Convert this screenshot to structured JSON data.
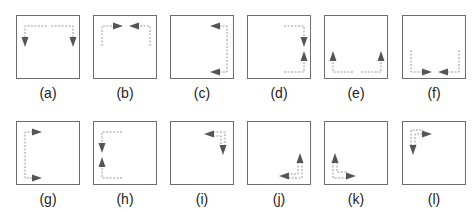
{
  "figure": {
    "colors": {
      "border": "#6e6e6e",
      "path": "#9a9a9a",
      "arrow": "#555555"
    },
    "panels": [
      {
        "label": "(a)",
        "description": "top edge paths from center outward, arrows pointing down at top-left and top-right corners",
        "paths": [
          "M30,10 L8,10 L8,22",
          "M34,10 L56,10 L56,22"
        ],
        "arrows": [
          {
            "x": 8,
            "y": 26,
            "dir": "down"
          },
          {
            "x": 56,
            "y": 26,
            "dir": "down"
          }
        ]
      },
      {
        "label": "(b)",
        "description": "paths up left/right sides then inward along top, arrows pointing toward center",
        "paths": [
          "M8,30 L8,10 L20,10",
          "M56,30 L56,10 L44,10"
        ],
        "arrows": [
          {
            "x": 24,
            "y": 10,
            "dir": "right"
          },
          {
            "x": 40,
            "y": 10,
            "dir": "left"
          }
        ]
      },
      {
        "label": "(c)",
        "description": "right edge path, arrows pointing left at top and bottom",
        "paths": [
          "M48,10 L56,10 L56,56 L48,56"
        ],
        "arrows": [
          {
            "x": 44,
            "y": 10,
            "dir": "left"
          },
          {
            "x": 44,
            "y": 56,
            "dir": "left"
          }
        ]
      },
      {
        "label": "(d)",
        "description": "paths from top and bottom along right edge, arrows meeting toward middle",
        "paths": [
          "M36,10 L56,10 L56,22",
          "M36,56 L56,56 L56,44"
        ],
        "arrows": [
          {
            "x": 56,
            "y": 26,
            "dir": "down"
          },
          {
            "x": 56,
            "y": 40,
            "dir": "up"
          }
        ]
      },
      {
        "label": "(e)",
        "description": "bottom edge paths from center outward, arrows pointing up at bottom-left and bottom-right",
        "paths": [
          "M28,56 L8,56 L8,44",
          "M36,56 L56,56 L56,44"
        ],
        "arrows": [
          {
            "x": 8,
            "y": 40,
            "dir": "up"
          },
          {
            "x": 56,
            "y": 40,
            "dir": "up"
          }
        ]
      },
      {
        "label": "(f)",
        "description": "paths down left/right sides then inward along bottom, arrows pointing toward center",
        "paths": [
          "M8,34 L8,56 L20,56",
          "M56,34 L56,56 L44,56"
        ],
        "arrows": [
          {
            "x": 24,
            "y": 56,
            "dir": "right"
          },
          {
            "x": 40,
            "y": 56,
            "dir": "left"
          }
        ]
      },
      {
        "label": "(g)",
        "description": "left edge path, arrows pointing right at top and bottom",
        "paths": [
          "M16,10 L8,10 L8,56 L16,56"
        ],
        "arrows": [
          {
            "x": 20,
            "y": 10,
            "dir": "right"
          },
          {
            "x": 20,
            "y": 56,
            "dir": "right"
          }
        ]
      },
      {
        "label": "(h)",
        "description": "paths from top and bottom along left edge, arrows meeting toward middle",
        "paths": [
          "M28,10 L8,10 L8,22",
          "M28,56 L8,56 L8,44"
        ],
        "arrows": [
          {
            "x": 8,
            "y": 26,
            "dir": "down"
          },
          {
            "x": 8,
            "y": 40,
            "dir": "up"
          }
        ]
      },
      {
        "label": "(i)",
        "description": "top-right corner L path with arrows pointing left and down",
        "paths": [
          "M42,10 L54,10 L54,24",
          "M42,14 L50,14 L50,24"
        ],
        "arrows": [
          {
            "x": 38,
            "y": 12,
            "dir": "left"
          },
          {
            "x": 52,
            "y": 28,
            "dir": "down"
          }
        ]
      },
      {
        "label": "(j)",
        "description": "bottom-right corner L path with arrows pointing up and left",
        "paths": [
          "M54,40 L54,56 L40,56",
          "M50,40 L50,52 L40,52"
        ],
        "arrows": [
          {
            "x": 52,
            "y": 36,
            "dir": "up"
          },
          {
            "x": 36,
            "y": 54,
            "dir": "left"
          }
        ]
      },
      {
        "label": "(k)",
        "description": "bottom-left corner L path with arrows pointing up and right",
        "paths": [
          "M8,40 L8,56 L22,56",
          "M12,40 L12,50 L22,50"
        ],
        "arrows": [
          {
            "x": 10,
            "y": 36,
            "dir": "up"
          },
          {
            "x": 26,
            "y": 54,
            "dir": "right"
          }
        ]
      },
      {
        "label": "(l)",
        "description": "top-left corner L path with arrows pointing down and right",
        "paths": [
          "M8,24 L8,8 L20,8",
          "M12,24 L12,12 L20,12"
        ],
        "arrows": [
          {
            "x": 10,
            "y": 28,
            "dir": "down"
          },
          {
            "x": 24,
            "y": 12,
            "dir": "right"
          }
        ]
      }
    ]
  }
}
